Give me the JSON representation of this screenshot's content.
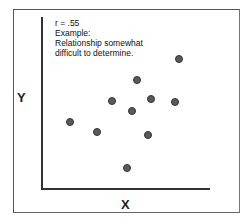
{
  "chart_data": {
    "type": "scatter",
    "title": "",
    "annotation": [
      "r = .55",
      "Example:",
      "Relationship somewhat",
      "difficult to determine."
    ],
    "xlabel": "X",
    "ylabel": "Y",
    "grid": false,
    "points_px": [
      {
        "x": 179,
        "y": 59
      },
      {
        "x": 137,
        "y": 80
      },
      {
        "x": 112,
        "y": 101
      },
      {
        "x": 151,
        "y": 99
      },
      {
        "x": 175,
        "y": 102
      },
      {
        "x": 132,
        "y": 111
      },
      {
        "x": 70,
        "y": 122
      },
      {
        "x": 97,
        "y": 132
      },
      {
        "x": 148,
        "y": 135
      },
      {
        "x": 127,
        "y": 168
      }
    ]
  },
  "labels": {
    "r": "r = .55",
    "line2": "Example:",
    "line3": "Relationship somewhat",
    "line4": "difficult to determine.",
    "x": "X",
    "y": "Y"
  }
}
